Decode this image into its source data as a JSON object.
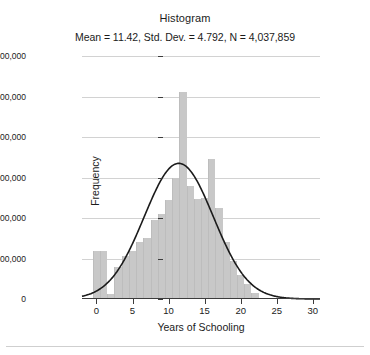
{
  "chart_data": {
    "type": "bar",
    "title": "Histogram",
    "subtitle": "Mean = 11.42, Std. Dev. = 4.792, N = 4,037,859",
    "xlabel": "Years of Schooling",
    "ylabel": "Frequency",
    "xlim": [
      -2,
      31
    ],
    "ylim": [
      0,
      600000
    ],
    "xticks": [
      0,
      5,
      10,
      15,
      20,
      25,
      30
    ],
    "xtick_labels": [
      "0",
      "5",
      "10",
      "15",
      "20",
      "25",
      "30"
    ],
    "yticks": [
      0,
      100000,
      200000,
      300000,
      400000,
      500000,
      600000
    ],
    "ytick_labels": [
      "0",
      "100,000",
      "200,000",
      "300,000",
      "400,000",
      "500,000",
      "600,000"
    ],
    "grid": "horizontal",
    "legend": "none",
    "bar_color": "#c8c8c8",
    "curve_color": "#1b1b1b",
    "bin_width": 1,
    "categories": [
      0,
      1,
      2,
      3,
      4,
      5,
      6,
      7,
      8,
      9,
      10,
      11,
      12,
      13,
      14,
      15,
      16,
      17,
      18,
      19,
      20,
      21,
      22
    ],
    "values": [
      118000,
      118000,
      12000,
      78000,
      105000,
      118000,
      140000,
      150000,
      196000,
      210000,
      245000,
      300000,
      510000,
      280000,
      247000,
      250000,
      345000,
      225000,
      140000,
      95000,
      60000,
      38000,
      14000
    ],
    "statistics": {
      "mean": 11.42,
      "std_dev": 4.792,
      "n": 4037859
    },
    "normal_curve": {
      "description": "Normal distribution overlay",
      "peak_value": 335000,
      "peak_x": 11.42
    }
  }
}
